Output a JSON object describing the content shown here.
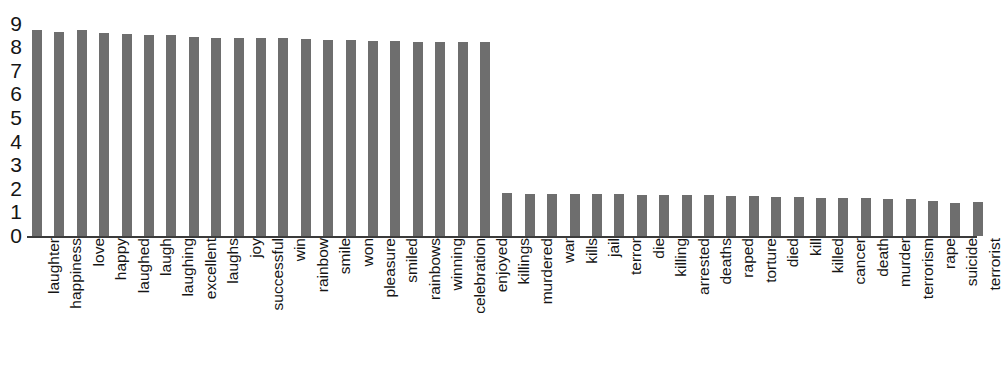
{
  "chart_data": {
    "type": "bar",
    "title": "",
    "subtitle": "",
    "xlabel": "",
    "ylabel": "",
    "ylim": [
      0,
      9
    ],
    "yticks": [
      0,
      1,
      2,
      3,
      4,
      5,
      6,
      7,
      8,
      9
    ],
    "ytick_labels": [
      "0",
      "1",
      "2",
      "3",
      "4",
      "5",
      "6",
      "7",
      "8",
      "9"
    ],
    "grid": false,
    "legend": null,
    "bar_color": "#6e6e6e",
    "axis_color": "#3b3b3b",
    "text_color": "#151515",
    "background_color": "#ffffff",
    "label_rotation": 90,
    "categories": [
      "laughter",
      "happiness",
      "love",
      "happy",
      "laughed",
      "laugh",
      "laughing",
      "excellent",
      "laughs",
      "joy",
      "successful",
      "win",
      "rainbow",
      "smile",
      "won",
      "pleasure",
      "smiled",
      "rainbows",
      "winning",
      "celebration",
      "enjoyed",
      "killings",
      "murdered",
      "war",
      "kills",
      "jail",
      "terror",
      "die",
      "killing",
      "arrested",
      "deaths",
      "raped",
      "torture",
      "died",
      "kill",
      "killed",
      "cancer",
      "death",
      "murder",
      "terrorism",
      "rape",
      "suicide",
      "terrorist"
    ],
    "values": [
      8.72,
      8.66,
      8.72,
      8.6,
      8.55,
      8.5,
      8.5,
      8.45,
      8.41,
      8.4,
      8.38,
      8.38,
      8.35,
      8.32,
      8.32,
      8.28,
      8.26,
      8.22,
      8.22,
      8.2,
      8.2,
      1.84,
      1.76,
      1.8,
      1.8,
      1.78,
      1.76,
      1.74,
      1.72,
      1.72,
      1.72,
      1.7,
      1.68,
      1.66,
      1.64,
      1.62,
      1.6,
      1.6,
      1.58,
      1.56,
      1.48,
      1.4,
      1.44
    ]
  }
}
